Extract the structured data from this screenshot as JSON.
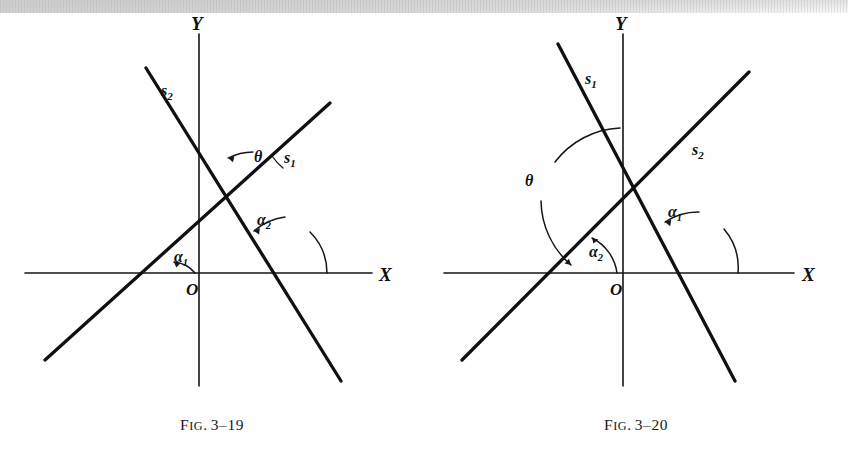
{
  "page": {
    "width": 848,
    "height": 462,
    "background": "#fefefe",
    "ink_color": "#16161a",
    "scan_artifact": "gray-band-top"
  },
  "figures": [
    {
      "id": "fig-3-19",
      "caption_prefix": "F",
      "caption_smallcaps": "IG",
      "caption_dot": ".",
      "caption_number": "3–19",
      "caption_full": "FIG. 3–19",
      "axes": {
        "x_label": "X",
        "y_label": "Y",
        "origin_label": "O"
      },
      "lines": [
        {
          "name": "s1",
          "label": "s",
          "subscript": "1",
          "description": "rising-line-left-to-right"
        },
        {
          "name": "s2",
          "label": "s",
          "subscript": "2",
          "description": "falling-line-left-to-right"
        }
      ],
      "angles": [
        {
          "name": "alpha1",
          "label": "α",
          "subscript": "1",
          "description": "acute-inclination-of-s1-with-x-axis"
        },
        {
          "name": "alpha2",
          "label": "α",
          "subscript": "2",
          "description": "obtuse-inclination-of-s2-with-x-axis"
        },
        {
          "name": "theta",
          "label": "θ",
          "subscript": "",
          "description": "angle-from-s1-to-s2-at-intersection"
        }
      ]
    },
    {
      "id": "fig-3-20",
      "caption_prefix": "F",
      "caption_smallcaps": "IG",
      "caption_dot": ".",
      "caption_number": "3–20",
      "caption_full": "FIG. 3–20",
      "axes": {
        "x_label": "X",
        "y_label": "Y",
        "origin_label": "O"
      },
      "lines": [
        {
          "name": "s1",
          "label": "s",
          "subscript": "1",
          "description": "falling-line-left-to-right"
        },
        {
          "name": "s2",
          "label": "s",
          "subscript": "2",
          "description": "rising-line-left-to-right"
        }
      ],
      "angles": [
        {
          "name": "alpha1",
          "label": "α",
          "subscript": "1",
          "description": "obtuse-inclination-of-s1-with-x-axis"
        },
        {
          "name": "alpha2",
          "label": "α",
          "subscript": "2",
          "description": "acute-inclination-of-s2-with-x-axis"
        },
        {
          "name": "theta",
          "label": "θ",
          "subscript": "",
          "description": "large-angle-from-s1-to-s2-at-intersection"
        }
      ]
    }
  ]
}
